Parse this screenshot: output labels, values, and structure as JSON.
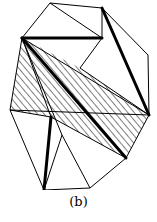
{
  "figure": {
    "caption": "(b)",
    "colors": {
      "line": "#000000",
      "background": "#ffffff"
    },
    "vertices": {
      "A": [
        50,
        3
      ],
      "B": [
        102,
        8
      ],
      "C": [
        148,
        55
      ],
      "D": [
        149,
        115
      ],
      "E": [
        22,
        38
      ],
      "F": [
        102,
        38
      ],
      "G": [
        80,
        68
      ],
      "H": [
        10,
        110
      ],
      "I": [
        51,
        117
      ],
      "M": [
        62,
        135
      ],
      "J": [
        126,
        158
      ],
      "K": [
        44,
        190
      ],
      "L": [
        90,
        188
      ]
    },
    "thin_edges": [
      [
        "A",
        "B"
      ],
      [
        "A",
        "E"
      ],
      [
        "A",
        "F"
      ],
      [
        "B",
        "F"
      ],
      [
        "B",
        "C"
      ],
      [
        "C",
        "D"
      ],
      [
        "E",
        "H"
      ],
      [
        "H",
        "K"
      ],
      [
        "K",
        "L"
      ],
      [
        "L",
        "J"
      ],
      [
        "J",
        "D"
      ],
      [
        "F",
        "G"
      ],
      [
        "E",
        "I"
      ],
      [
        "H",
        "I"
      ],
      [
        "I",
        "J"
      ],
      [
        "E",
        "D"
      ],
      [
        "G",
        "D"
      ],
      [
        "M",
        "L"
      ],
      [
        "M",
        "K"
      ],
      [
        "H",
        "D"
      ],
      [
        "E",
        "M"
      ]
    ],
    "thick_edges": [
      [
        "E",
        "F"
      ],
      [
        "B",
        "D"
      ],
      [
        "E",
        "J"
      ],
      [
        "I",
        "K"
      ]
    ],
    "hatched_region": [
      "E",
      "G",
      "D",
      "J",
      "I",
      "H"
    ]
  }
}
